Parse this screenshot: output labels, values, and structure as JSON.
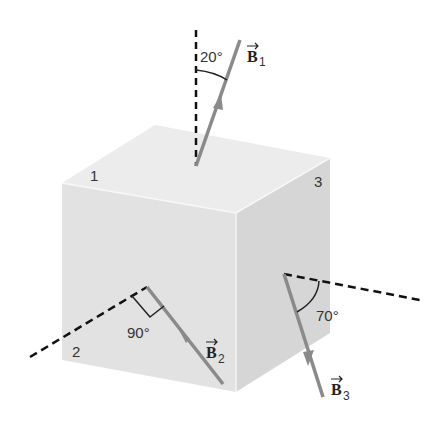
{
  "diagram": {
    "faces": {
      "top": "1",
      "front": "2",
      "right": "3"
    },
    "vectors": [
      {
        "name": "B",
        "subscript": "1",
        "angle_label": "20°",
        "reference": "normal to face 1"
      },
      {
        "name": "B",
        "subscript": "2",
        "angle_label": "90°",
        "reference": "normal to face 2"
      },
      {
        "name": "B",
        "subscript": "3",
        "angle_label": "70°",
        "reference": "normal to face 3"
      }
    ],
    "colors": {
      "top_face": "#ececec",
      "front_face": "#e2e2e2",
      "right_face": "#d6d6d6",
      "vector": "#8a8a8a",
      "dashed_normal": "#111111"
    }
  }
}
